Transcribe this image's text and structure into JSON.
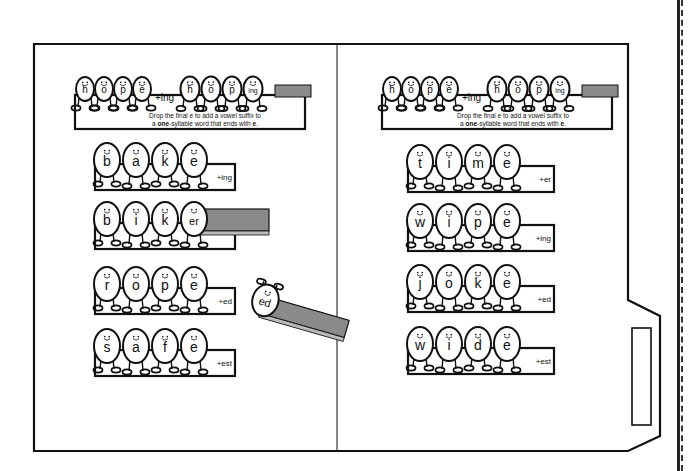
{
  "worksheet": {
    "title": "Drop the final e spelling rule file folder",
    "panels": [
      {
        "side": "left",
        "example": {
          "base_letters": [
            "h",
            "o",
            "p",
            "e"
          ],
          "suffix": "+ing",
          "result_letters": [
            "h",
            "o",
            "p",
            "ing"
          ],
          "caption_line1": "Drop the final e to add a vowel suffix to",
          "caption_line2_pre": "a ",
          "caption_line2_bold": "one",
          "caption_line2_mid": "-syllable word that ends with ",
          "caption_line2_bold2": "e",
          "caption_line2_end": "."
        },
        "strips": [
          {
            "letters": [
              "b",
              "a",
              "k",
              "e"
            ],
            "suffix": "+ing"
          },
          {
            "letters": [
              "b",
              "i",
              "k",
              "er"
            ],
            "suffix": "",
            "slide": true
          },
          {
            "letters": [
              "r",
              "o",
              "p",
              "e"
            ],
            "suffix": "+ed"
          },
          {
            "letters": [
              "s",
              "a",
              "f",
              "e"
            ],
            "suffix": "+est"
          }
        ],
        "loose_egg": {
          "letter": "ed"
        }
      },
      {
        "side": "right",
        "example": {
          "base_letters": [
            "h",
            "o",
            "p",
            "e"
          ],
          "suffix": "+ing",
          "result_letters": [
            "h",
            "o",
            "p",
            "ing"
          ],
          "caption_line1": "Drop the final e to add a vowel suffix to",
          "caption_line2_pre": "a ",
          "caption_line2_bold": "one",
          "caption_line2_mid": "-syllable word that ends with ",
          "caption_line2_bold2": "e",
          "caption_line2_end": "."
        },
        "strips": [
          {
            "letters": [
              "t",
              "i",
              "m",
              "e"
            ],
            "suffix": "+er"
          },
          {
            "letters": [
              "w",
              "i",
              "p",
              "e"
            ],
            "suffix": "+ing"
          },
          {
            "letters": [
              "j",
              "o",
              "k",
              "e"
            ],
            "suffix": "+ed"
          },
          {
            "letters": [
              "w",
              "i",
              "d",
              "e"
            ],
            "suffix": "+est"
          }
        ]
      }
    ],
    "colors": {
      "stroke": "#111111",
      "slide": "#8a8a8a",
      "paper": "#ffffff"
    }
  }
}
